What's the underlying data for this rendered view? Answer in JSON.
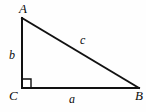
{
  "figure": {
    "type": "right-triangle-diagram",
    "background_color": "#fefefe",
    "stroke_color": "#111111",
    "vertices": [
      {
        "name": "A",
        "label": "A",
        "x": 22,
        "y": 18
      },
      {
        "name": "C",
        "label": "C",
        "x": 22,
        "y": 88
      },
      {
        "name": "B",
        "label": "B",
        "x": 139,
        "y": 88
      }
    ],
    "sides": [
      {
        "name": "a",
        "label": "a",
        "between": "C-B",
        "position": "below-base"
      },
      {
        "name": "b",
        "label": "b",
        "between": "A-C",
        "position": "left-of-leg"
      },
      {
        "name": "c",
        "label": "c",
        "between": "A-B",
        "position": "above-hypotenuse"
      }
    ],
    "right_angle": {
      "at_vertex": "C",
      "marker": "square",
      "size": 9
    },
    "path": {
      "leg_vertical": "M22,18 L22,88",
      "base_horizontal": "M22,88 L139,88",
      "hypotenuse": "M22,18 L139,88",
      "right_angle_marker": "M22,79 L31,79 L31,88"
    }
  }
}
